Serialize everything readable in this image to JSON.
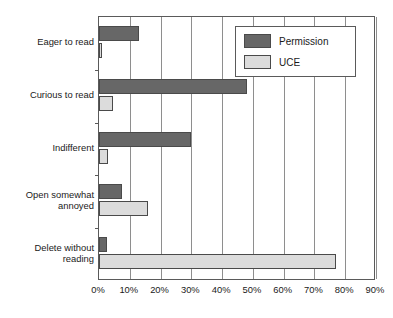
{
  "chart_data": {
    "type": "bar",
    "orientation": "horizontal",
    "title": "",
    "subtitle": "",
    "xlabel": "",
    "ylabel": "",
    "xlim": [
      0,
      90
    ],
    "xticks": [
      0,
      10,
      20,
      30,
      40,
      50,
      60,
      70,
      80,
      90
    ],
    "xtick_labels": [
      "0%",
      "10%",
      "20%",
      "30%",
      "40%",
      "50%",
      "60%",
      "70%",
      "80%",
      "90%"
    ],
    "grid": "vertical",
    "legend_position": "upper-right",
    "categories": [
      "Eager to read",
      "Curious to read",
      "Indifferent",
      "Open somewhat\nannoyed",
      "Delete without\nreading"
    ],
    "series": [
      {
        "name": "Permission",
        "color": "#676767",
        "values": [
          13,
          48,
          30,
          7.5,
          2.5
        ]
      },
      {
        "name": "UCE",
        "color": "#dcdcdc",
        "values": [
          1,
          4.5,
          3,
          16,
          77
        ]
      }
    ]
  },
  "legend": {
    "entries": [
      {
        "label": "Permission"
      },
      {
        "label": "UCE"
      }
    ]
  },
  "axis": {
    "tick_labels": [
      "0%",
      "10%",
      "20%",
      "30%",
      "40%",
      "50%",
      "60%",
      "70%",
      "80%",
      "90%"
    ]
  }
}
